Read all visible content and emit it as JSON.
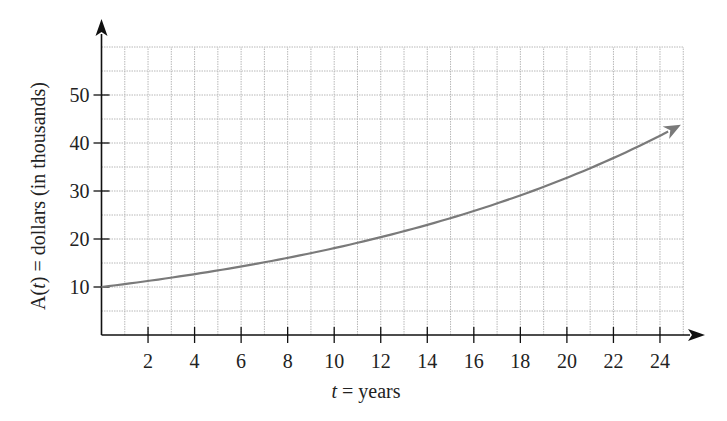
{
  "chart_data": {
    "type": "line",
    "title": "",
    "xlabel": "t = years",
    "xlabel_var": "t",
    "xlabel_rest": " = years",
    "ylabel": "A(t) = dollars (in thousands)",
    "ylabel_parts": {
      "a": "A(",
      "t": "t",
      "rest": ") = dollars (in thousands)"
    },
    "xlim": [
      0,
      25
    ],
    "ylim": [
      0,
      60
    ],
    "x_ticks": [
      2,
      4,
      6,
      8,
      10,
      12,
      14,
      16,
      18,
      20,
      22,
      24
    ],
    "y_ticks": [
      10,
      20,
      30,
      40,
      50
    ],
    "grid": {
      "on": true,
      "x_step": 1,
      "y_step": 5,
      "style": "dotted"
    },
    "legend": null,
    "series": [
      {
        "name": "A(t)",
        "formula": "A(t) = 10·e^(0.0593 t)",
        "x": [
          0,
          2,
          4,
          6,
          8,
          10,
          12,
          14,
          16,
          18,
          20,
          22,
          24,
          24.9
        ],
        "values": [
          10.0,
          11.3,
          12.7,
          14.3,
          16.1,
          18.1,
          20.4,
          23.0,
          25.8,
          29.1,
          32.7,
          36.9,
          41.5,
          43.8
        ],
        "color": "#7a7a7a",
        "end_arrow": true
      }
    ]
  },
  "colors": {
    "axis": "#111111",
    "grid": "#b8b8b8",
    "curve": "#7a7a7a",
    "text": "#222222"
  }
}
